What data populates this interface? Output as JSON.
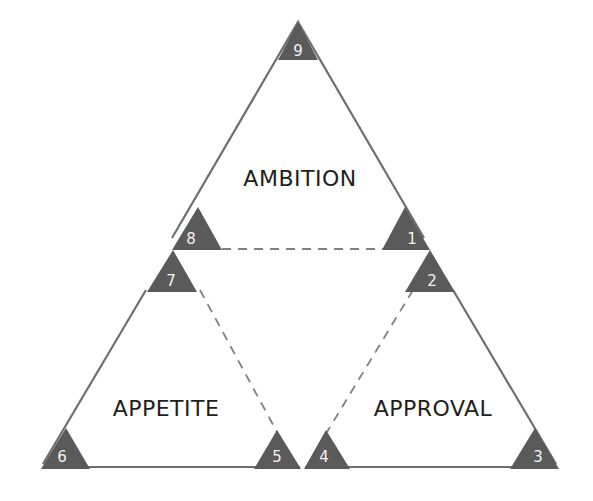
{
  "diagram": {
    "sections": [
      {
        "label": "AMBITION"
      },
      {
        "label": "APPETITE"
      },
      {
        "label": "APPROVAL"
      }
    ],
    "markers": [
      "1",
      "2",
      "3",
      "4",
      "5",
      "6",
      "7",
      "8",
      "9"
    ],
    "colors": {
      "outline": "#6e6e6e",
      "marker_fill": "#5a5a5a",
      "marker_text": "#f2f2f2",
      "dashed_line": "#808080",
      "label_text": "#1e1e1e"
    }
  }
}
